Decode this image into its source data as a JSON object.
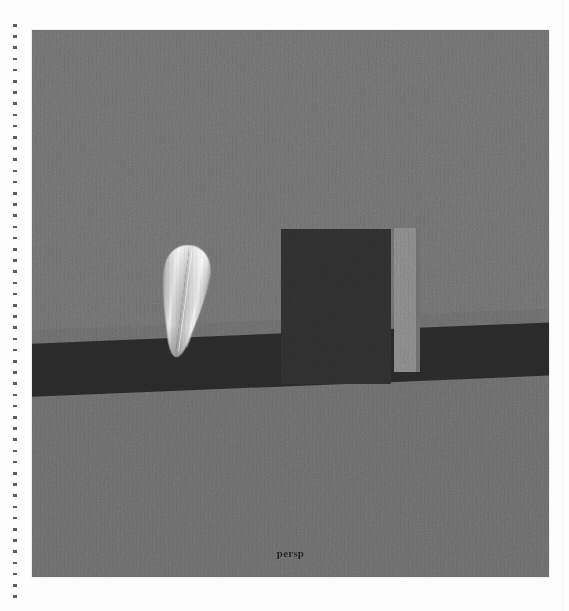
{
  "viewport": {
    "camera_label": "persp",
    "background_color": "#6e6e6e",
    "floor_color": "#6a6a6a",
    "ground_band_color": "#282828"
  },
  "objects": [
    {
      "name": "seed-mesh",
      "label": "seed",
      "shape": "teardrop",
      "fill_color": "#d9d9d9"
    },
    {
      "name": "dark-box",
      "label": "box",
      "shape": "rectangle",
      "fill_color": "#2e2e2e"
    },
    {
      "name": "pillar",
      "label": "pillar",
      "shape": "rectangle",
      "fill_color": "#858585"
    },
    {
      "name": "ground-band",
      "label": "ground",
      "shape": "band",
      "fill_color": "#282828"
    }
  ],
  "page": {
    "margin_rule": "dotted",
    "margin_rule_color": "#3a3a3a",
    "background_color": "#fdfdfd"
  }
}
